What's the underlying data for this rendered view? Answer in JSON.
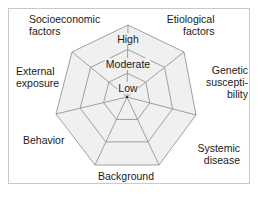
{
  "diagram": {
    "type": "radar-web",
    "center": [
      127,
      97
    ],
    "axes": [
      {
        "id": "etiological",
        "label_lines": [
          "Etiological",
          "factors"
        ],
        "vertex": [
          184,
          52
        ]
      },
      {
        "id": "genetic",
        "label_lines": [
          "Genetic",
          "suscepti-",
          "bility"
        ],
        "vertex": [
          196,
          115
        ]
      },
      {
        "id": "systemic",
        "label_lines": [
          "Systemic",
          "disease"
        ],
        "vertex": [
          159,
          165
        ]
      },
      {
        "id": "background",
        "label_lines": [
          "Background"
        ],
        "vertex": [
          95,
          165
        ]
      },
      {
        "id": "behavior",
        "label_lines": [
          "Behavior"
        ],
        "vertex": [
          56,
          114
        ]
      },
      {
        "id": "external",
        "label_lines": [
          "External",
          "exposure"
        ],
        "vertex": [
          72,
          52
        ]
      },
      {
        "id": "socioeconomic",
        "label_lines": [
          "Socioeconomic",
          "factors"
        ],
        "vertex": [
          128,
          25
        ]
      }
    ],
    "levels": [
      {
        "label": "Low",
        "fraction": 0.33
      },
      {
        "label": "Moderate",
        "fraction": 0.66
      },
      {
        "label": "High",
        "fraction": 1.0
      }
    ],
    "colors": {
      "fill": "#f0f0f0",
      "stroke": "#8a8a8a",
      "frame": "#c9c9c9",
      "text": "#1a1a1a"
    }
  },
  "labels": {
    "socioeconomic_1": "Socioeconomic",
    "socioeconomic_2": "factors",
    "etiological_1": "Etiological",
    "etiological_2": "factors",
    "external_1": "External",
    "external_2": "exposure",
    "genetic_1": "Genetic",
    "genetic_2": "suscepti-",
    "genetic_3": "bility",
    "behavior": "Behavior",
    "systemic_1": "Systemic",
    "systemic_2": "disease",
    "background": "Background",
    "level_high": "High",
    "level_moderate": "Moderate",
    "level_low": "Low"
  }
}
